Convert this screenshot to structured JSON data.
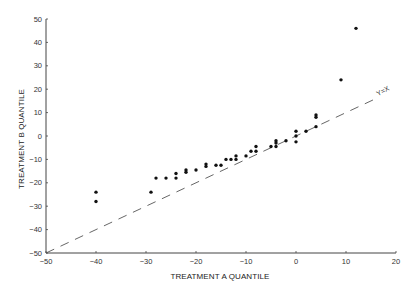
{
  "chart_data": {
    "type": "scatter",
    "title": "",
    "xlabel": "TREATMENT A QUANTILE",
    "ylabel": "TREATMENT B QUANTILE",
    "xlim": [
      -50,
      20
    ],
    "ylim": [
      -50,
      50
    ],
    "xticks": [
      -50,
      -40,
      -30,
      -20,
      -10,
      0,
      10,
      20
    ],
    "yticks": [
      -50,
      -40,
      -30,
      -20,
      -10,
      0,
      10,
      20,
      30,
      40,
      50
    ],
    "grid": false,
    "legend": null,
    "reference_line": {
      "label": "Y=X",
      "style": "dashed",
      "from": [
        -50,
        -50
      ],
      "to": [
        16.5,
        16.5
      ]
    },
    "series": [
      {
        "name": "quantile pairs",
        "points": [
          [
            -40,
            -24
          ],
          [
            -40,
            -28
          ],
          [
            -29,
            -24
          ],
          [
            -28,
            -18
          ],
          [
            -26,
            -18
          ],
          [
            -24,
            -16
          ],
          [
            -24,
            -18
          ],
          [
            -22,
            -14.5
          ],
          [
            -22,
            -15.5
          ],
          [
            -20,
            -14.5
          ],
          [
            -18,
            -12
          ],
          [
            -18,
            -13
          ],
          [
            -16,
            -12.5
          ],
          [
            -15,
            -12.5
          ],
          [
            -14,
            -10
          ],
          [
            -13,
            -10
          ],
          [
            -12,
            -8.5
          ],
          [
            -12,
            -10
          ],
          [
            -10,
            -8.5
          ],
          [
            -9,
            -6.5
          ],
          [
            -8,
            -4.5
          ],
          [
            -8,
            -6.5
          ],
          [
            -5,
            -4.5
          ],
          [
            -4,
            -2
          ],
          [
            -4,
            -3
          ],
          [
            -4,
            -4.5
          ],
          [
            -2,
            -2
          ],
          [
            0,
            2
          ],
          [
            0,
            0
          ],
          [
            0,
            -2.5
          ],
          [
            2,
            2
          ],
          [
            4,
            9
          ],
          [
            4,
            8
          ],
          [
            4,
            4
          ],
          [
            9,
            24
          ],
          [
            12,
            46
          ]
        ]
      }
    ]
  },
  "axes": {
    "x_title": "TREATMENT A QUANTILE",
    "y_title": "TREATMENT B QUANTILE",
    "ref_line_label": "Y=X"
  },
  "colors": {
    "points": "#111111",
    "axes": "#444444",
    "ref_line": "#555555"
  }
}
